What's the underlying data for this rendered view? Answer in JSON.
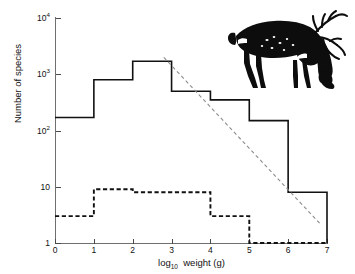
{
  "figure": {
    "background_color": "#ffffff",
    "ink_color": "#111111",
    "axis_color": "#6f6f6f"
  },
  "axes": {
    "x_title_main": "weight (g)",
    "x_title_prefix": "log",
    "x_title_subscript": "10",
    "y_title": "Number of species",
    "x_ticks": [
      "0",
      "1",
      "2",
      "3",
      "4",
      "5",
      "6",
      "7"
    ],
    "y_tick_labels": [
      "1",
      "10",
      "10",
      "10",
      "10"
    ],
    "y_tick_exponents": [
      "",
      "",
      "2",
      "3",
      "4"
    ]
  },
  "inset": {
    "name": "grazing-deer-silhouette",
    "description": "black silhouette of a grazing deer with antlers",
    "fill_color": "#0d0d0d"
  },
  "chart_data": {
    "type": "bar",
    "title": "",
    "subtitle": "",
    "xlabel": "log10 weight (g)",
    "ylabel": "Number of species",
    "xlim": [
      0,
      7
    ],
    "ylim": [
      1,
      10000
    ],
    "yscale": "log",
    "grid": false,
    "legend_position": "none",
    "bin_edges": [
      0,
      1,
      2,
      3,
      4,
      5,
      6,
      7
    ],
    "categories": [
      "0-1",
      "1-2",
      "2-3",
      "3-4",
      "4-5",
      "5-6",
      "6-7"
    ],
    "series": [
      {
        "name": "All species",
        "style": "solid-step",
        "color": "#111111",
        "values": [
          170,
          800,
          1700,
          500,
          350,
          150,
          8
        ]
      },
      {
        "name": "Extinct or threatened species",
        "style": "dashed-step",
        "color": "#111111",
        "values": [
          3,
          9,
          8,
          8,
          3,
          1,
          1
        ]
      }
    ],
    "annotations": [
      {
        "name": "regression-trend-line",
        "style": "dashed",
        "color": "#8c8c8c",
        "x_start": 2.8,
        "y_start": 2000,
        "x_end": 6.85,
        "y_end": 2.1
      }
    ]
  }
}
